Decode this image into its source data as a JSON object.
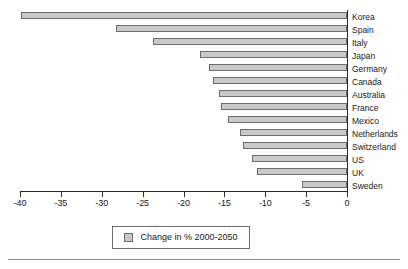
{
  "chart_data": {
    "type": "bar",
    "orientation": "horizontal",
    "title": "",
    "subtitle": "",
    "xlabel": "",
    "ylabel": "",
    "xlim": [
      -40,
      0
    ],
    "xticks": [
      -40,
      -35,
      -30,
      -25,
      -20,
      -15,
      -10,
      -5,
      0
    ],
    "xticklabels": [
      "-40",
      "-35",
      "-30",
      "-25",
      "-20",
      "-15",
      "-10",
      "-5",
      "0"
    ],
    "grid": false,
    "legend_position": "bottom-center",
    "legend": [
      "Change in % 2000-2050"
    ],
    "categories": [
      "Korea",
      "Spain",
      "Italy",
      "Japan",
      "Germany",
      "Canada",
      "Australia",
      "France",
      "Mexico",
      "Netherlands",
      "Switzerland",
      "US",
      "UK",
      "Sweden"
    ],
    "series": [
      {
        "name": "Change in % 2000-2050",
        "values": [
          -39.9,
          -28.3,
          -23.7,
          -18.0,
          -16.9,
          -16.4,
          -15.7,
          -15.4,
          -14.6,
          -13.1,
          -12.7,
          -11.6,
          -11.0,
          -5.5
        ]
      }
    ],
    "colors": {
      "bar_fill": "#c9c9c9",
      "bar_border": "#6d6d6d",
      "axis": "#2b2b2b",
      "text": "#1a1a1a",
      "rule": "#8a8a8a"
    }
  },
  "legend": {
    "label": "Change in % 2000-2050",
    "swatch_name": "bar-color-swatch"
  }
}
